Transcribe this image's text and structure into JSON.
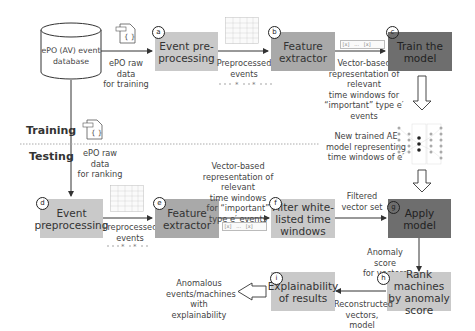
{
  "sections": {
    "training": "Training",
    "testing": "Testing"
  },
  "database": {
    "label_line1": "ePO (AV) event",
    "label_line2": "database"
  },
  "training": {
    "raw_data_label_1": "ePO raw data",
    "raw_data_label_2": "for training",
    "step_a": {
      "badge": "a",
      "label_1": "Event pre-",
      "label_2": "processing"
    },
    "preprocessed_label_1": "Preprocessed",
    "preprocessed_label_2": "events",
    "step_b": {
      "badge": "b",
      "label_1": "Feature",
      "label_2": "extractor"
    },
    "vector_label_1": "Vector-based",
    "vector_label_2": "representation of relevant",
    "vector_label_3": "time windows for",
    "vector_label_4": "“important” type e′ events",
    "step_c": {
      "badge": "c",
      "label_1": "Train the",
      "label_2": "model"
    },
    "model_label_1": "New trained AE",
    "model_label_2": "model representing",
    "model_label_3": "time windows of e′"
  },
  "testing": {
    "raw_data_label_1": "ePO raw data",
    "raw_data_label_2": "for ranking",
    "step_d": {
      "badge": "d",
      "label_1": "Event",
      "label_2": "preprocessing"
    },
    "preprocessed_label_1": "Preprocessed",
    "preprocessed_label_2": "events",
    "step_e": {
      "badge": "e",
      "label_1": "Feature",
      "label_2": "extractor"
    },
    "vector_label_1": "Vector-based",
    "vector_label_2": "representation of relevant",
    "vector_label_3": "time windows",
    "vector_label_4": "for “important”",
    "vector_label_5": "type e′ events",
    "step_f": {
      "badge": "f",
      "label_1": "Filter white-",
      "label_2": "listed time",
      "label_3": "windows"
    },
    "filtered_label_1": "Filtered",
    "filtered_label_2": "vector set",
    "step_g": {
      "badge": "g",
      "label_1": "Apply model"
    },
    "anomaly_label_1": "Anomaly score",
    "anomaly_label_2": "for vectors",
    "step_h": {
      "badge": "h",
      "label_1": "Rank machines",
      "label_2": "by anomaly",
      "label_3": "score"
    },
    "reconstructed_label_1": "Reconstructed",
    "reconstructed_label_2": "vectors, model",
    "step_i": {
      "badge": "i",
      "label_1": "Explainability",
      "label_2": "of results"
    },
    "output_label_1": "Anomalous",
    "output_label_2": "events/machines",
    "output_label_3": "with explainability"
  },
  "icons": {
    "json_file": "json-file-icon",
    "table": "table-icon",
    "timeline": "timeline-icon",
    "vector": "vector-icon",
    "autoencoder": "neural-network-icon"
  },
  "colors": {
    "light_box": "#c9c9c9",
    "mid_box": "#a9a9a9",
    "dark_box": "#6e6e6e",
    "arrow": "#333333"
  }
}
